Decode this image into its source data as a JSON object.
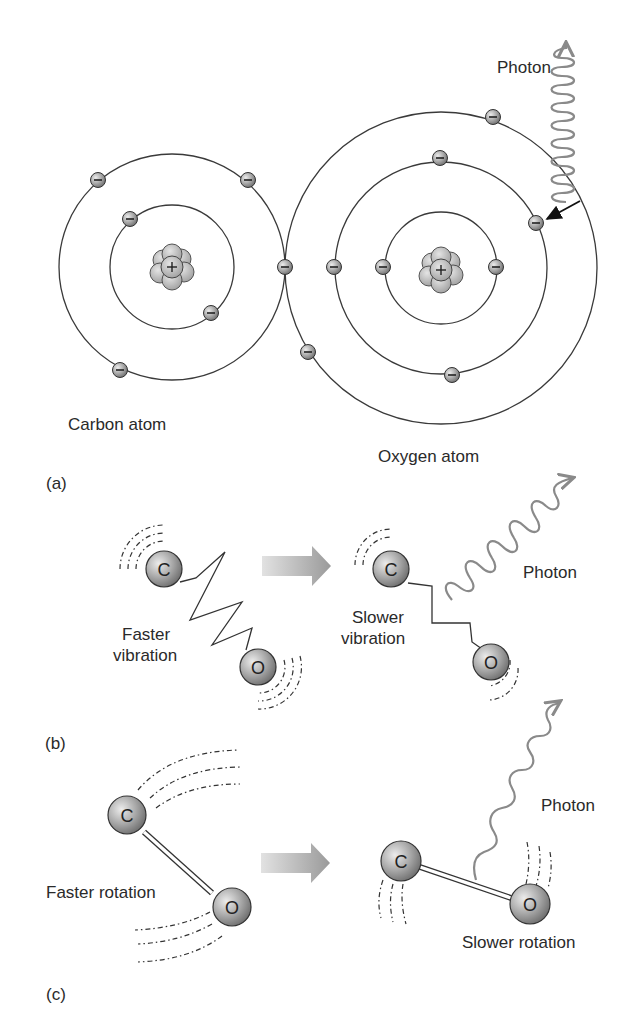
{
  "figure": {
    "panels": [
      {
        "id": "a",
        "label": "(a)",
        "description": "Bohr models of carbon and oxygen atoms; photon absorbed by oxygen electron",
        "atoms": [
          {
            "name": "Carbon atom",
            "shells": 2,
            "electrons": 6
          },
          {
            "name": "Oxygen atom",
            "shells": 3,
            "electrons": 8
          }
        ],
        "photon_label": "Photon"
      },
      {
        "id": "b",
        "label": "(b)",
        "before": {
          "text_line1": "Faster",
          "text_line2": "vibration",
          "atom1": "C",
          "atom2": "O"
        },
        "after": {
          "text_line1": "Slower",
          "text_line2": "vibration",
          "atom1": "C",
          "atom2": "O"
        },
        "photon_label": "Photon"
      },
      {
        "id": "c",
        "label": "(c)",
        "before": {
          "text": "Faster rotation",
          "atom1": "C",
          "atom2": "O"
        },
        "after": {
          "text": "Slower rotation",
          "atom1": "C",
          "atom2": "O"
        },
        "photon_label": "Photon"
      }
    ],
    "symbols": {
      "nucleus": "+",
      "electron": "−"
    },
    "colors": {
      "line": "#3a3a3a",
      "sphere_light": "#e6e6e6",
      "sphere_dark": "#7a7a7a",
      "photon": "#8a8a8a",
      "arrow_start": "#e0e0e0",
      "arrow_end": "#9a9a9a"
    }
  }
}
